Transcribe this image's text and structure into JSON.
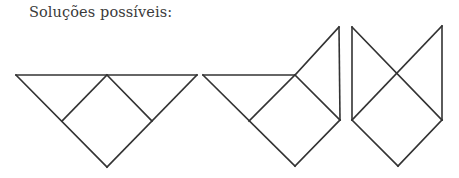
{
  "heading": "Soluções possíveis:",
  "colors": {
    "stroke": "#333333",
    "text": "#3a3a3a",
    "background": "#ffffff"
  },
  "figures": [
    {
      "name": "solution-1-triangle",
      "segments": [
        [
          16,
          75,
          197,
          75
        ],
        [
          16,
          75,
          107,
          167
        ],
        [
          197,
          75,
          107,
          167
        ],
        [
          107,
          75,
          62,
          121
        ],
        [
          107,
          75,
          152,
          121
        ]
      ]
    },
    {
      "name": "solution-2-triangle-with-flag",
      "segments": [
        [
          203,
          75,
          295,
          75
        ],
        [
          203,
          75,
          295,
          166
        ],
        [
          295,
          166,
          340,
          120
        ],
        [
          295,
          75,
          339,
          27
        ],
        [
          339,
          27,
          340,
          120
        ],
        [
          295,
          75,
          340,
          120
        ],
        [
          295,
          75,
          249,
          121
        ]
      ]
    },
    {
      "name": "solution-3-pentagon-with-cross",
      "segments": [
        [
          352,
          27,
          352,
          120
        ],
        [
          442,
          26,
          442,
          120
        ],
        [
          352,
          27,
          442,
          120
        ],
        [
          442,
          26,
          352,
          120
        ],
        [
          352,
          120,
          398,
          166
        ],
        [
          442,
          120,
          398,
          166
        ]
      ]
    }
  ]
}
